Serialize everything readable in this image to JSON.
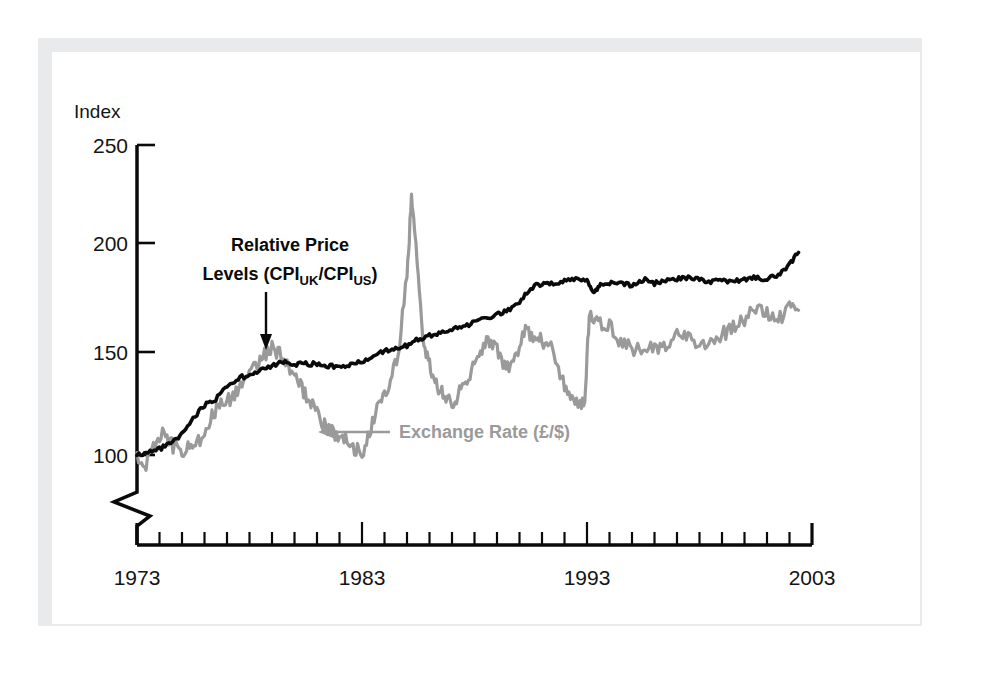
{
  "figure": {
    "background_color": "#ffffff",
    "frame_color": "#e9eaec",
    "plate_color": "#ffffff"
  },
  "chart_data": {
    "type": "line",
    "title": "",
    "subtitle": "",
    "xlabel": "",
    "ylabel": "Index",
    "ylabel_position": "top-left",
    "grid": false,
    "legend": "inline-annotations",
    "axis_break": true,
    "axis_break_note": "zigzag break on y-axis below 100",
    "xlim": [
      1973,
      2003
    ],
    "ylim": [
      100,
      250
    ],
    "ytick_labels": [
      "100",
      "150",
      "200",
      "250"
    ],
    "ytick_values": [
      100,
      150,
      200,
      250
    ],
    "xtick_labels": [
      "1973",
      "1983",
      "1993",
      "2003"
    ],
    "xtick_values": [
      1973,
      1983,
      1993,
      2003
    ],
    "xtick_minor_interval": 1,
    "annotations": [
      {
        "name": "relative-price-levels-annotation",
        "line1": "Relative Price",
        "line2_pre": "Levels (CPI",
        "line2_sub1": "UK",
        "line2_mid": "/CPI",
        "line2_sub2": "US",
        "line2_post": ")",
        "color": "#0a0a0a",
        "arrow": "down"
      },
      {
        "name": "exchange-rate-annotation",
        "text": "Exchange Rate (£/$)",
        "color": "#9a9a9a",
        "arrow": "left"
      }
    ],
    "series": [
      {
        "name": "Relative Price Levels (CPI_UK/CPI_US)",
        "color": "#0a0a0a",
        "x": [
          1973.0,
          1973.5,
          1974.0,
          1974.5,
          1975.0,
          1975.5,
          1976.0,
          1976.5,
          1977.0,
          1977.5,
          1978.0,
          1978.5,
          1979.0,
          1979.5,
          1980.0,
          1980.5,
          1981.0,
          1981.5,
          1982.0,
          1982.5,
          1983.0,
          1983.5,
          1984.0,
          1984.5,
          1985.0,
          1985.5,
          1986.0,
          1986.5,
          1987.0,
          1987.5,
          1988.0,
          1988.5,
          1989.0,
          1989.5,
          1990.0,
          1990.5,
          1991.0,
          1991.5,
          1992.0,
          1992.5,
          1993.0,
          1993.3,
          1993.6,
          1994.0,
          1994.5,
          1995.0,
          1995.5,
          1996.0,
          1996.5,
          1997.0,
          1997.5,
          1998.0,
          1998.5,
          1999.0,
          1999.5,
          2000.0,
          2000.5,
          2001.0,
          2001.5,
          2002.0,
          2002.4
        ],
        "values": [
          100,
          101,
          103,
          106,
          110,
          118,
          124,
          127,
          133,
          137,
          139,
          141,
          143,
          145,
          144,
          144,
          144,
          143,
          143,
          144,
          145,
          148,
          150,
          152,
          153,
          156,
          158,
          159,
          161,
          162,
          164,
          166,
          168,
          170,
          174,
          181,
          183,
          183,
          184,
          185,
          184,
          178,
          183,
          183,
          183,
          182,
          185,
          183,
          184,
          185,
          186,
          185,
          184,
          184,
          184,
          185,
          186,
          185,
          187,
          192,
          198
        ]
      },
      {
        "name": "Exchange Rate (£/$)",
        "color": "#9a9a9a",
        "x": [
          1973.0,
          1973.4,
          1973.8,
          1974.2,
          1974.6,
          1975.0,
          1975.4,
          1975.8,
          1976.2,
          1976.6,
          1977.0,
          1977.4,
          1977.8,
          1978.2,
          1978.6,
          1979.0,
          1979.4,
          1979.8,
          1980.2,
          1980.6,
          1981.0,
          1981.4,
          1981.8,
          1982.2,
          1982.6,
          1983.0,
          1983.4,
          1983.8,
          1984.2,
          1984.6,
          1985.0,
          1985.2,
          1985.4,
          1985.7,
          1986.0,
          1986.3,
          1986.6,
          1987.0,
          1987.4,
          1987.8,
          1988.2,
          1988.6,
          1989.0,
          1989.4,
          1989.8,
          1990.2,
          1990.6,
          1991.0,
          1991.4,
          1991.8,
          1992.2,
          1992.6,
          1992.9,
          1993.1,
          1993.5,
          1994.0,
          1994.5,
          1995.0,
          1995.5,
          1996.0,
          1996.5,
          1997.0,
          1997.5,
          1998.0,
          1998.5,
          1999.0,
          1999.5,
          2000.0,
          2000.5,
          2001.0,
          2001.5,
          2002.0,
          2002.4
        ],
        "values": [
          100,
          96,
          104,
          112,
          104,
          101,
          106,
          108,
          116,
          124,
          126,
          130,
          136,
          143,
          148,
          152,
          148,
          140,
          134,
          128,
          120,
          113,
          110,
          109,
          104,
          101,
          112,
          128,
          134,
          148,
          186,
          225,
          200,
          158,
          143,
          134,
          131,
          124,
          132,
          140,
          148,
          155,
          152,
          141,
          146,
          160,
          158,
          155,
          152,
          140,
          128,
          124,
          127,
          168,
          164,
          162,
          155,
          152,
          149,
          152,
          154,
          158,
          156,
          154,
          155,
          158,
          162,
          166,
          170,
          168,
          165,
          172,
          170
        ]
      }
    ]
  }
}
